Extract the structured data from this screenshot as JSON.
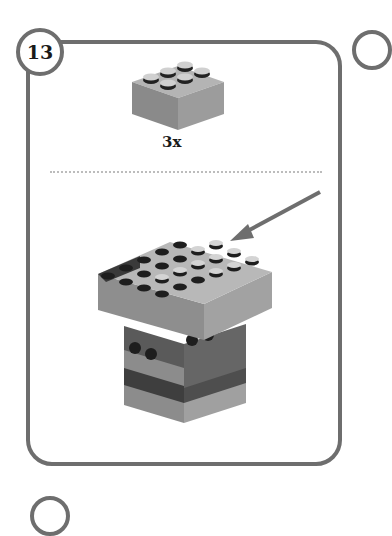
{
  "step": {
    "number": "13",
    "parts_needed": {
      "piece": "2x3 brick",
      "quantity_label": "3x"
    },
    "colors": {
      "frame": "#6e6e6e",
      "brick_light": "#9a9a9a",
      "brick_mid": "#7c7c7c",
      "brick_dark": "#4a4a4a",
      "stud_dark": "#1e1e1e"
    },
    "annotation": "arrow-pointing-to-placement"
  }
}
